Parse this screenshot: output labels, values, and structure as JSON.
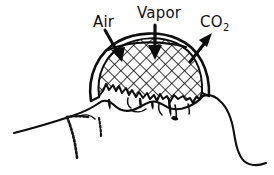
{
  "figure": {
    "kind": "line-drawing",
    "background_color": "#ffffff",
    "ink_color": "#0d0d0d",
    "width": 274,
    "height": 175
  },
  "labels": {
    "air": "Air",
    "vapor": "Vapor",
    "co2_base": "CO",
    "co2_subscript": "2"
  },
  "arrows": [
    {
      "id": "air-arrow",
      "label": "Air",
      "direction": "down-right",
      "points_into_mass": true
    },
    {
      "id": "vapor-arrow",
      "label": "Vapor",
      "direction": "down",
      "points_into_mass": true
    },
    {
      "id": "co2-arrow",
      "label": "CO2",
      "direction": "up-right",
      "points_into_mass": false
    }
  ],
  "elements": {
    "dome_outline": "outer-shell-arc",
    "hatched_core": "cross-hatched-interior",
    "ground_line": "irregular-terrain-profile",
    "drips": "melt-drip-protrusions",
    "scribble_marks": "illegible-hatch-scribble"
  }
}
